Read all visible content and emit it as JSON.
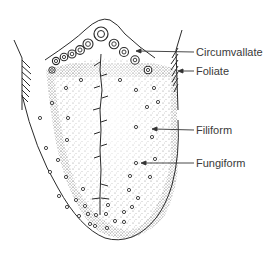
{
  "figure": {
    "labels": [
      {
        "id": "circumvallate",
        "text": "Circumvallate",
        "x": 196,
        "y": 46
      },
      {
        "id": "foliate",
        "text": "Foliate",
        "x": 196,
        "y": 65
      },
      {
        "id": "filiform",
        "text": "Filiform",
        "x": 196,
        "y": 124
      },
      {
        "id": "fungiform",
        "text": "Fungiform",
        "x": 196,
        "y": 157
      }
    ],
    "colors": {
      "ink": "#2a2a2a",
      "stipple": "#6a6a6a",
      "background": "#ffffff"
    }
  }
}
